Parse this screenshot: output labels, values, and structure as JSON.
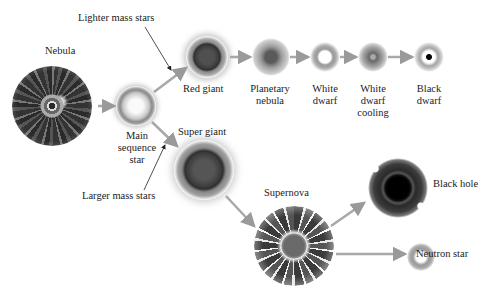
{
  "diagram": {
    "stages": {
      "nebula": "Nebula",
      "main_sequence": [
        "Main",
        "sequence",
        "star"
      ],
      "red_giant": "Red giant",
      "planetary_nebula": [
        "Planetary",
        "nebula"
      ],
      "white_dwarf": [
        "White",
        "dwarf"
      ],
      "white_dwarf_cooling": [
        "White",
        "dwarf",
        "cooling"
      ],
      "black_dwarf": [
        "Black",
        "dwarf"
      ],
      "super_giant": "Super giant",
      "supernova": "Supernova",
      "black_hole": "Black hole",
      "neutron_star": "Neutron star"
    },
    "branches": {
      "lighter": "Lighter mass stars",
      "larger": "Larger mass stars"
    },
    "flows": [
      [
        "Nebula",
        "Main sequence star"
      ],
      [
        "Main sequence star",
        "Red giant"
      ],
      [
        "Red giant",
        "Planetary nebula"
      ],
      [
        "Planetary nebula",
        "White dwarf"
      ],
      [
        "White dwarf",
        "White dwarf cooling"
      ],
      [
        "White dwarf cooling",
        "Black dwarf"
      ],
      [
        "Main sequence star",
        "Super giant"
      ],
      [
        "Super giant",
        "Supernova"
      ],
      [
        "Supernova",
        "Black hole"
      ],
      [
        "Supernova",
        "Neutron star"
      ]
    ]
  }
}
